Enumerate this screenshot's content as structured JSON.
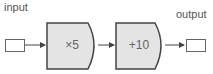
{
  "diagram": {
    "input_label": "input",
    "output_label": "output",
    "steps": [
      {
        "operation": "×5"
      },
      {
        "operation": "+10"
      }
    ],
    "colors": {
      "block_fill": "#e4e4e4",
      "stroke": "#444444",
      "text": "#666666"
    }
  }
}
